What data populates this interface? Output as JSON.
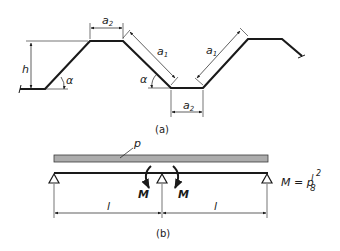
{
  "figure_a": {
    "caption": "(a)",
    "labels": {
      "height": "h",
      "angle_left": "α",
      "angle_right": "α",
      "top_flange": "a",
      "top_flange_sub": "2",
      "bottom_flange": "a",
      "bottom_flange_sub": "2",
      "web_left": "a",
      "web_left_sub": "1",
      "web_right": "a",
      "web_right_sub": "1"
    }
  },
  "figure_b": {
    "caption": "(b)",
    "load_label": "p",
    "moment_left": "M",
    "moment_right": "M",
    "span_left": "l",
    "span_right": "l",
    "formula": {
      "lhs": "M = p",
      "numerator": "l",
      "exponent": "2",
      "denominator": "8"
    }
  },
  "colors": {
    "ink": "#1a1a1a",
    "hatch": "#8a8a8a"
  }
}
